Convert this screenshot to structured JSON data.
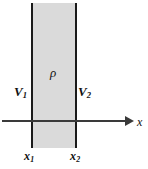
{
  "figure": {
    "labels": {
      "potential_left": "V",
      "potential_left_sub": "1",
      "potential_right": "V",
      "potential_right_sub": "2",
      "charge_density": "ρ",
      "boundary_left": "x",
      "boundary_left_sub": "1",
      "boundary_right": "x",
      "boundary_right_sub": "2",
      "axis_label": "x"
    },
    "colors": {
      "slab_fill": "#dadada",
      "plane_line": "#1a1a1a",
      "axis": "#3a3a3a",
      "text": "#111111",
      "background": "#ffffff"
    }
  }
}
